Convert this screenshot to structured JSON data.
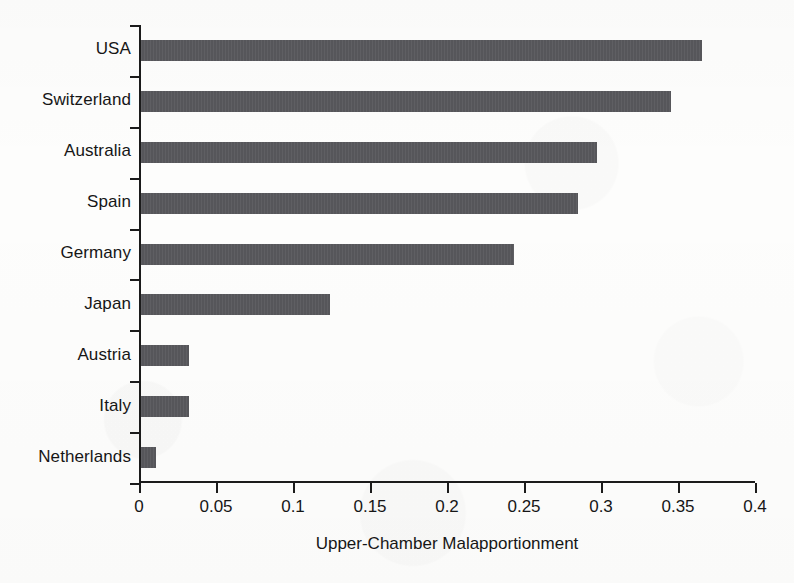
{
  "chart_data": {
    "type": "bar",
    "orientation": "horizontal",
    "title": "",
    "xlabel": "Upper-Chamber Malapportionment",
    "ylabel": "",
    "categories": [
      "USA",
      "Switzerland",
      "Australia",
      "Spain",
      "Germany",
      "Japan",
      "Austria",
      "Italy",
      "Netherlands"
    ],
    "values": [
      0.364,
      0.344,
      0.296,
      0.284,
      0.242,
      0.123,
      0.031,
      0.031,
      0.01
    ],
    "xlim": [
      0,
      0.4
    ],
    "xticks": [
      0,
      0.05,
      0.1,
      0.15,
      0.2,
      0.25,
      0.3,
      0.35,
      0.4
    ],
    "xtick_labels": [
      "0",
      "0.05",
      "0.1",
      "0.15",
      "0.2",
      "0.25",
      "0.3",
      "0.35",
      "0.4"
    ],
    "grid": false,
    "legend": null,
    "bar_color": "#56565a",
    "axis_color": "#1b1b1b",
    "background_color": "#fdfdfc"
  }
}
